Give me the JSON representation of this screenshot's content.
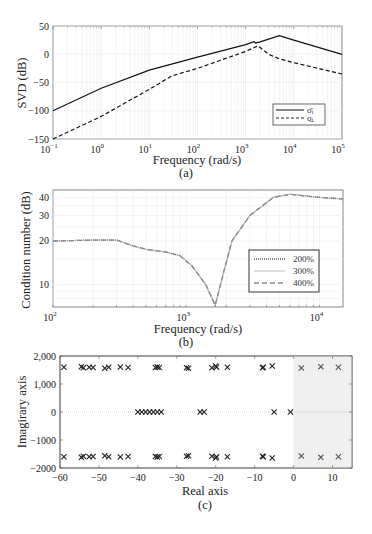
{
  "chart_data": [
    {
      "id": "a",
      "type": "line",
      "subtitle": "(a)",
      "xlabel": "Frequency (rad/s)",
      "ylabel": "SVD (dB)",
      "xscale": "log",
      "xlim": [
        0.1,
        100000
      ],
      "ylim": [
        -150,
        50
      ],
      "xticks": [
        "10^-1",
        "10^0",
        "10^1",
        "10^2",
        "10^3",
        "10^4",
        "10^5"
      ],
      "yticks": [
        50,
        0,
        -50,
        -100,
        -150
      ],
      "grid": true,
      "legend_position": "lower right",
      "series": [
        {
          "name": "σ̄i (max singular value)",
          "style": "solid",
          "x": [
            0.1,
            1,
            10,
            100,
            1000,
            1500,
            1600,
            2000,
            5000,
            10000,
            100000
          ],
          "y": [
            -100,
            -60,
            -28,
            -5,
            17,
            22,
            20,
            22,
            33,
            25,
            0
          ]
        },
        {
          "name": "σ̲i (min singular value)",
          "style": "dashed",
          "x": [
            0.1,
            1,
            10,
            30,
            100,
            1000,
            1800,
            3000,
            5000,
            10000,
            100000
          ],
          "y": [
            -150,
            -110,
            -62,
            -38,
            -25,
            5,
            15,
            0,
            -8,
            -15,
            -35
          ]
        }
      ]
    },
    {
      "id": "b",
      "type": "line",
      "subtitle": "(b)",
      "xlabel": "Frequency (rad/s)",
      "ylabel": "Condition number (dB)",
      "xscale": "log",
      "yscale": "log",
      "xlim": [
        100,
        15000
      ],
      "ylim": [
        7,
        45
      ],
      "xticks": [
        "10^2",
        "10^3",
        "10^4"
      ],
      "yticks": [
        40,
        30,
        20,
        10
      ],
      "grid": true,
      "legend_position": "right",
      "series": [
        {
          "name": "200%",
          "style": "dotted",
          "x": [
            100,
            200,
            300,
            400,
            500,
            700,
            900,
            1100,
            1400,
            1650,
            1900,
            2200,
            3000,
            4500,
            6000,
            10000,
            15000
          ],
          "y": [
            20,
            20.3,
            20.3,
            18.5,
            17.5,
            16.8,
            15.8,
            13.5,
            10,
            7.2,
            12,
            20,
            30,
            40,
            42,
            40,
            39
          ]
        },
        {
          "name": "300%",
          "style": "solid-light",
          "x": [
            100,
            200,
            300,
            400,
            500,
            700,
            900,
            1100,
            1400,
            1650,
            1900,
            2200,
            3000,
            4500,
            6000,
            10000,
            15000
          ],
          "y": [
            20,
            20.3,
            20.3,
            18.5,
            17.5,
            16.8,
            15.8,
            13.5,
            10,
            7.2,
            12,
            20,
            30,
            40,
            42,
            40,
            39
          ]
        },
        {
          "name": "400%",
          "style": "dashed",
          "x": [
            100,
            200,
            300,
            400,
            500,
            700,
            900,
            1100,
            1400,
            1650,
            1900,
            2200,
            3000,
            4500,
            6000,
            10000,
            15000
          ],
          "y": [
            20,
            20.3,
            20.3,
            18.5,
            17.5,
            16.8,
            15.8,
            13.5,
            10,
            7.2,
            12,
            20,
            30,
            40,
            42,
            40,
            39
          ]
        }
      ]
    },
    {
      "id": "c",
      "type": "scatter",
      "subtitle": "(c)",
      "xlabel": "Real axis",
      "ylabel": "Imagirary axis",
      "xlim": [
        -60,
        15
      ],
      "ylim": [
        -2000,
        2000
      ],
      "xticks": [
        -60,
        -50,
        -40,
        -30,
        -20,
        -10,
        0,
        10
      ],
      "yticks": [
        "2,000",
        "1,000",
        "0",
        "-1000",
        "-2000"
      ],
      "marker": "x",
      "shaded_region": {
        "x": [
          0,
          15
        ],
        "color": "#efefef"
      },
      "poles": {
        "upper": [
          [
            -59,
            1600
          ],
          [
            -54.5,
            1620
          ],
          [
            -54,
            1580
          ],
          [
            -52.5,
            1600
          ],
          [
            -51.5,
            1590
          ],
          [
            -48.5,
            1560
          ],
          [
            -47.5,
            1600
          ],
          [
            -44.5,
            1610
          ],
          [
            -42.5,
            1590
          ],
          [
            -35.5,
            1590
          ],
          [
            -35,
            1610
          ],
          [
            -34.5,
            1590
          ],
          [
            -27.5,
            1580
          ],
          [
            -27,
            1560
          ],
          [
            -21,
            1580
          ],
          [
            -20,
            1640
          ],
          [
            -19.8,
            1600
          ],
          [
            -17,
            1600
          ],
          [
            -8,
            1580
          ],
          [
            -7.8,
            1600
          ],
          [
            -5.5,
            1640
          ],
          [
            2,
            1570
          ],
          [
            7,
            1620
          ],
          [
            11.5,
            1600
          ]
        ],
        "real": [
          [
            -40,
            0
          ],
          [
            -39,
            0
          ],
          [
            -38,
            0
          ],
          [
            -37,
            0
          ],
          [
            -36,
            0
          ],
          [
            -35,
            0
          ],
          [
            -34,
            0
          ],
          [
            -24,
            0
          ],
          [
            -23,
            0
          ],
          [
            -5,
            0
          ],
          [
            -0.8,
            0
          ]
        ],
        "lower": [
          [
            -59,
            -1600
          ],
          [
            -54.5,
            -1620
          ],
          [
            -54,
            -1580
          ],
          [
            -52.5,
            -1600
          ],
          [
            -51.5,
            -1590
          ],
          [
            -48.5,
            -1560
          ],
          [
            -47.5,
            -1600
          ],
          [
            -44.5,
            -1610
          ],
          [
            -42.5,
            -1590
          ],
          [
            -35.5,
            -1590
          ],
          [
            -35,
            -1610
          ],
          [
            -34.5,
            -1590
          ],
          [
            -27.5,
            -1580
          ],
          [
            -27,
            -1560
          ],
          [
            -21,
            -1580
          ],
          [
            -20,
            -1640
          ],
          [
            -19.8,
            -1600
          ],
          [
            -17,
            -1600
          ],
          [
            -8,
            -1580
          ],
          [
            -7.8,
            -1600
          ],
          [
            -5.5,
            -1640
          ],
          [
            2,
            -1570
          ],
          [
            7,
            -1620
          ],
          [
            11.5,
            -1600
          ]
        ]
      }
    }
  ],
  "labels": {
    "a": {
      "xlabel": "Frequency (rad/s)",
      "ylabel": "SVD (dB)",
      "subtitle": "(a)",
      "legend": [
        "σ̄ᵢ",
        "σ̲ᵢ"
      ],
      "xticks": [
        "10",
        "10",
        "10",
        "10",
        "10",
        "10",
        "10"
      ],
      "xexp": [
        "−1",
        "0",
        "1",
        "2",
        "3",
        "4",
        "5"
      ],
      "yticks": [
        "50",
        "0",
        "−50",
        "−100",
        "−150"
      ]
    },
    "b": {
      "xlabel": "Frequency (rad/s)",
      "ylabel": "Condition number (dB)",
      "subtitle": "(b)",
      "legend": [
        "200%",
        "300%",
        "400%"
      ],
      "xticks": [
        "10",
        "10",
        "10"
      ],
      "xexp": [
        "2",
        "3",
        "4"
      ],
      "yticks": [
        "40",
        "30",
        "20",
        "10"
      ]
    },
    "c": {
      "xlabel": "Real axis",
      "ylabel": "Imagirary axis",
      "subtitle": "(c)",
      "xticks": [
        "−60",
        "−50",
        "−40",
        "−30",
        "−20",
        "−10",
        "0",
        "10"
      ],
      "yticks": [
        "2,000",
        "1,000",
        "0",
        "−1000",
        "−2000"
      ]
    }
  }
}
